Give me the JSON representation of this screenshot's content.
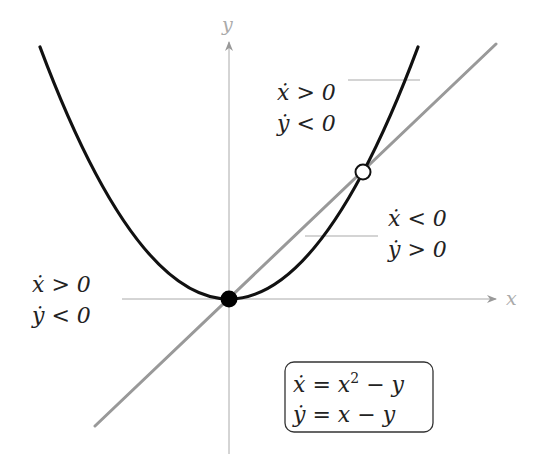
{
  "axes": {
    "x_label": "x",
    "y_label": "y",
    "axis_color": "#aaaaaa"
  },
  "curves": {
    "parabola": {
      "label": "y = x^2 (x-nullcline)",
      "color": "#111111"
    },
    "line": {
      "label": "y = x (y-nullcline)",
      "color": "#999999"
    }
  },
  "fixed_points": [
    {
      "name": "origin",
      "coords": "(0,0)",
      "style": "filled",
      "color": "#000000"
    },
    {
      "name": "unit",
      "coords": "(1,1)",
      "style": "open",
      "color": "#ffffff"
    }
  ],
  "region_labels": [
    {
      "x_line": "ẋ > 0",
      "y_line": "ẏ < 0",
      "position": "upper-right"
    },
    {
      "x_line": "ẋ < 0",
      "y_line": "ẏ > 0",
      "position": "middle-right"
    },
    {
      "x_line": "ẋ > 0",
      "y_line": "ẏ < 0",
      "position": "left"
    }
  ],
  "system": {
    "eq1_lhs": "ẋ",
    "eq1_rhs_a": "x",
    "eq1_sup": "2",
    "eq1_rhs_b": " − y",
    "eq2_lhs": "ẏ",
    "eq2_rhs": "x − y",
    "equals": " = "
  }
}
